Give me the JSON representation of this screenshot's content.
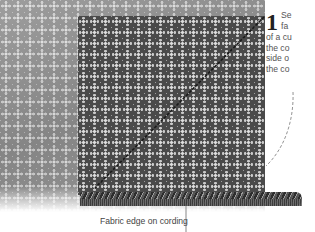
{
  "step": {
    "number": "1",
    "lines": [
      "Se",
      "fa",
      "of a cu",
      "the co",
      "side o",
      "the co"
    ]
  },
  "callout": {
    "label": "Fabric edge on cording"
  },
  "colors": {
    "light_fabric": "#8c8c8c",
    "dark_fabric": "#4a4a4a",
    "cord": "#444444",
    "text": "#555555"
  }
}
